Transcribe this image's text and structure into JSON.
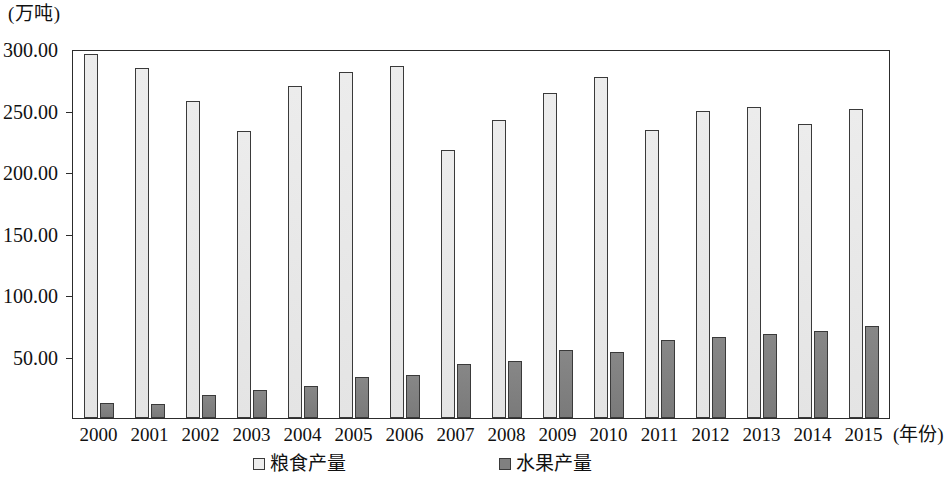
{
  "unit_caption": "(万吨)",
  "x_axis_title": "(年份)",
  "y_axis": {
    "tick_labels": [
      "50.00",
      "100.00",
      "150.00",
      "200.00",
      "250.00",
      "300.00"
    ],
    "tick_values": [
      50,
      100,
      150,
      200,
      250,
      300
    ]
  },
  "legend": {
    "items": [
      {
        "label": "粮食产量",
        "swatch": "grain",
        "color": "#ededed"
      },
      {
        "label": "水果产量",
        "swatch": "fruit",
        "color": "#808080"
      }
    ]
  },
  "chart_data": {
    "type": "bar",
    "title": "",
    "subtitle": "",
    "xlabel": "(年份)",
    "ylabel": "(万吨)",
    "ylim": [
      0,
      300
    ],
    "yticks": [
      50,
      100,
      150,
      200,
      250,
      300
    ],
    "grid": false,
    "legend_position": "bottom",
    "categories": [
      "2000",
      "2001",
      "2002",
      "2003",
      "2004",
      "2005",
      "2006",
      "2007",
      "2008",
      "2009",
      "2010",
      "2011",
      "2012",
      "2013",
      "2014",
      "2015"
    ],
    "series": [
      {
        "name": "粮食产量",
        "color": "#ededed",
        "values": [
          297.5,
          286.5,
          259.5,
          234.5,
          271.5,
          282.5,
          288.0,
          219.0,
          243.5,
          266.0,
          278.5,
          235.5,
          251.0,
          254.5,
          240.5,
          252.5
        ]
      },
      {
        "name": "水果产量",
        "color": "#808080",
        "values": [
          12.5,
          11.5,
          18.5,
          23.0,
          26.5,
          33.5,
          35.0,
          44.0,
          47.0,
          56.0,
          54.0,
          64.0,
          66.5,
          68.5,
          71.5,
          75.5
        ]
      }
    ]
  }
}
